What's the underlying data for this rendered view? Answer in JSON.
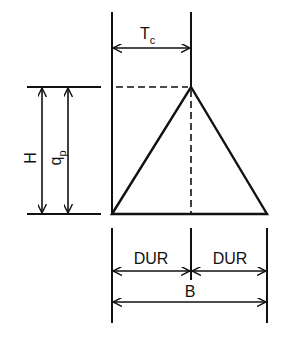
{
  "diagram": {
    "type": "triangular unit hydrograph",
    "labels": {
      "tc_main": "T",
      "tc_sub": "c",
      "h": "H",
      "qp_main": "q",
      "qp_sub": "p",
      "dur_left": "DUR",
      "dur_right": "DUR",
      "b": "B"
    },
    "colors": {
      "stroke": "#111111",
      "background": "#ffffff"
    }
  }
}
